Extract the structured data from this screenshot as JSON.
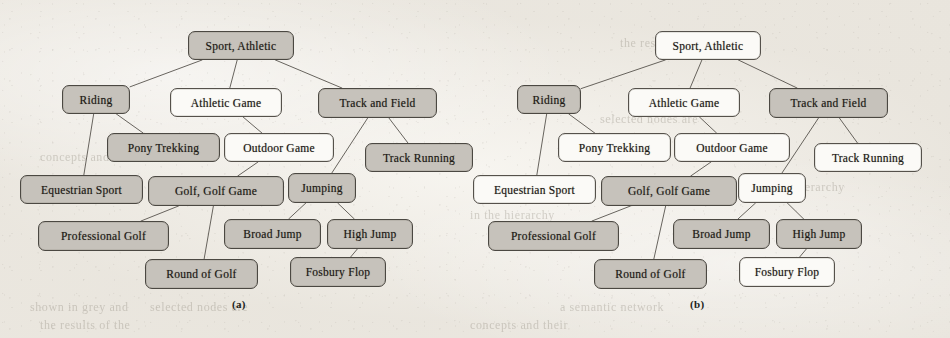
{
  "figure": {
    "caption_a": "(a)",
    "caption_b": "(b)",
    "colors": {
      "shaded": "#c6c2bb",
      "unshaded": "#fbfaf7",
      "outline": "#55514b",
      "page": "#efece6"
    },
    "page_bleed_text": [
      "the  results  of  the",
      "concepts  and  their",
      "in  the  hierarchy",
      "selected  nodes  are",
      "shown  in  grey  and",
      "a  semantic  network"
    ]
  },
  "panels": [
    {
      "id": "a",
      "label": "(a)",
      "nodes": [
        {
          "id": "sport",
          "label": "Sport, Athletic",
          "shaded": true,
          "x": 188,
          "y": 31,
          "w": 106,
          "h": 29
        },
        {
          "id": "riding",
          "label": "Riding",
          "shaded": true,
          "x": 62,
          "y": 85,
          "w": 68,
          "h": 29
        },
        {
          "id": "athgame",
          "label": "Athletic Game",
          "shaded": false,
          "x": 170,
          "y": 88,
          "w": 112,
          "h": 29
        },
        {
          "id": "trackfield",
          "label": "Track and Field",
          "shaded": true,
          "x": 318,
          "y": 88,
          "w": 119,
          "h": 30
        },
        {
          "id": "pony",
          "label": "Pony Trekking",
          "shaded": true,
          "x": 107,
          "y": 133,
          "w": 113,
          "h": 29
        },
        {
          "id": "outdoor",
          "label": "Outdoor Game",
          "shaded": false,
          "x": 224,
          "y": 133,
          "w": 110,
          "h": 29
        },
        {
          "id": "trackrun",
          "label": "Track Running",
          "shaded": true,
          "x": 365,
          "y": 143,
          "w": 108,
          "h": 29
        },
        {
          "id": "equestrian",
          "label": "Equestrian Sport",
          "shaded": true,
          "x": 20,
          "y": 175,
          "w": 123,
          "h": 29
        },
        {
          "id": "golf",
          "label": "Golf, Golf Game",
          "shaded": true,
          "x": 148,
          "y": 176,
          "w": 136,
          "h": 30
        },
        {
          "id": "jumping",
          "label": "Jumping",
          "shaded": true,
          "x": 288,
          "y": 173,
          "w": 68,
          "h": 30
        },
        {
          "id": "progolf",
          "label": "Professional Golf",
          "shaded": true,
          "x": 38,
          "y": 221,
          "w": 131,
          "h": 30
        },
        {
          "id": "broad",
          "label": "Broad Jump",
          "shaded": true,
          "x": 224,
          "y": 219,
          "w": 97,
          "h": 30
        },
        {
          "id": "high",
          "label": "High Jump",
          "shaded": true,
          "x": 327,
          "y": 219,
          "w": 86,
          "h": 30
        },
        {
          "id": "round",
          "label": "Round of Golf",
          "shaded": true,
          "x": 145,
          "y": 259,
          "w": 113,
          "h": 30
        },
        {
          "id": "fosbury",
          "label": "Fosbury Flop",
          "shaded": true,
          "x": 290,
          "y": 257,
          "w": 96,
          "h": 30
        }
      ],
      "edges": [
        [
          "sport",
          "riding"
        ],
        [
          "sport",
          "athgame"
        ],
        [
          "sport",
          "trackfield"
        ],
        [
          "riding",
          "pony"
        ],
        [
          "riding",
          "equestrian"
        ],
        [
          "athgame",
          "outdoor"
        ],
        [
          "trackfield",
          "jumping"
        ],
        [
          "trackfield",
          "trackrun"
        ],
        [
          "outdoor",
          "golf"
        ],
        [
          "golf",
          "progolf"
        ],
        [
          "golf",
          "round"
        ],
        [
          "jumping",
          "broad"
        ],
        [
          "jumping",
          "high"
        ],
        [
          "high",
          "fosbury"
        ]
      ]
    },
    {
      "id": "b",
      "label": "(b)",
      "nodes": [
        {
          "id": "sport",
          "label": "Sport, Athletic",
          "shaded": false,
          "x": 655,
          "y": 31,
          "w": 106,
          "h": 29
        },
        {
          "id": "riding",
          "label": "Riding",
          "shaded": true,
          "x": 517,
          "y": 85,
          "w": 64,
          "h": 29
        },
        {
          "id": "athgame",
          "label": "Athletic Game",
          "shaded": false,
          "x": 628,
          "y": 88,
          "w": 112,
          "h": 29
        },
        {
          "id": "trackfield",
          "label": "Track and Field",
          "shaded": true,
          "x": 769,
          "y": 88,
          "w": 119,
          "h": 30
        },
        {
          "id": "pony",
          "label": "Pony Trekking",
          "shaded": false,
          "x": 558,
          "y": 133,
          "w": 113,
          "h": 29
        },
        {
          "id": "outdoor",
          "label": "Outdoor Game",
          "shaded": false,
          "x": 674,
          "y": 133,
          "w": 116,
          "h": 29
        },
        {
          "id": "trackrun",
          "label": "Track Running",
          "shaded": false,
          "x": 814,
          "y": 143,
          "w": 108,
          "h": 29
        },
        {
          "id": "equestrian",
          "label": "Equestrian Sport",
          "shaded": false,
          "x": 473,
          "y": 175,
          "w": 123,
          "h": 29
        },
        {
          "id": "golf",
          "label": "Golf, Golf Game",
          "shaded": true,
          "x": 601,
          "y": 176,
          "w": 136,
          "h": 30
        },
        {
          "id": "jumping",
          "label": "Jumping",
          "shaded": false,
          "x": 738,
          "y": 173,
          "w": 68,
          "h": 30
        },
        {
          "id": "progolf",
          "label": "Professional Golf",
          "shaded": true,
          "x": 488,
          "y": 221,
          "w": 131,
          "h": 30
        },
        {
          "id": "broad",
          "label": "Broad Jump",
          "shaded": true,
          "x": 673,
          "y": 219,
          "w": 97,
          "h": 30
        },
        {
          "id": "high",
          "label": "High Jump",
          "shaded": true,
          "x": 776,
          "y": 219,
          "w": 86,
          "h": 30
        },
        {
          "id": "round",
          "label": "Round of Golf",
          "shaded": true,
          "x": 594,
          "y": 259,
          "w": 113,
          "h": 30
        },
        {
          "id": "fosbury",
          "label": "Fosbury Flop",
          "shaded": false,
          "x": 739,
          "y": 257,
          "w": 96,
          "h": 30
        }
      ],
      "edges": [
        [
          "sport",
          "riding"
        ],
        [
          "sport",
          "athgame"
        ],
        [
          "sport",
          "trackfield"
        ],
        [
          "riding",
          "pony"
        ],
        [
          "riding",
          "equestrian"
        ],
        [
          "athgame",
          "outdoor"
        ],
        [
          "trackfield",
          "jumping"
        ],
        [
          "trackfield",
          "trackrun"
        ],
        [
          "outdoor",
          "golf"
        ],
        [
          "golf",
          "progolf"
        ],
        [
          "golf",
          "round"
        ],
        [
          "jumping",
          "broad"
        ],
        [
          "jumping",
          "high"
        ],
        [
          "high",
          "fosbury"
        ]
      ]
    }
  ],
  "captions": [
    {
      "id": "cap-a",
      "label": "(a)",
      "x": 232,
      "y": 298
    },
    {
      "id": "cap-b",
      "label": "(b)",
      "x": 690,
      "y": 298
    }
  ]
}
